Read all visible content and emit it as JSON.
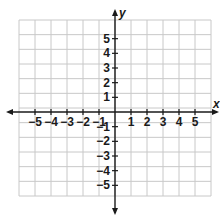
{
  "chart_data": {
    "type": "coordinate_plane",
    "title": "",
    "xlabel": "x",
    "ylabel": "y",
    "x_tick_labels": [
      "−5",
      "−4",
      "−3",
      "−2",
      "−1",
      "1",
      "2",
      "3",
      "4",
      "5"
    ],
    "y_tick_labels_positive": [
      "5",
      "4",
      "3",
      "2",
      "1"
    ],
    "y_tick_labels_negative": [
      "−1",
      "−2",
      "−3",
      "−4",
      "−5"
    ],
    "x_ticks": [
      -5,
      -4,
      -3,
      -2,
      -1,
      1,
      2,
      3,
      4,
      5
    ],
    "y_ticks": [
      5,
      4,
      3,
      2,
      1,
      -1,
      -2,
      -3,
      -4,
      -5
    ],
    "grid": true,
    "grid_columns": 12,
    "grid_rows": 12,
    "axis_arrows": true,
    "data_points": []
  },
  "colors": {
    "axis": "#1a1a1a",
    "grid": "#c8c8c8",
    "background": "#ffffff"
  }
}
